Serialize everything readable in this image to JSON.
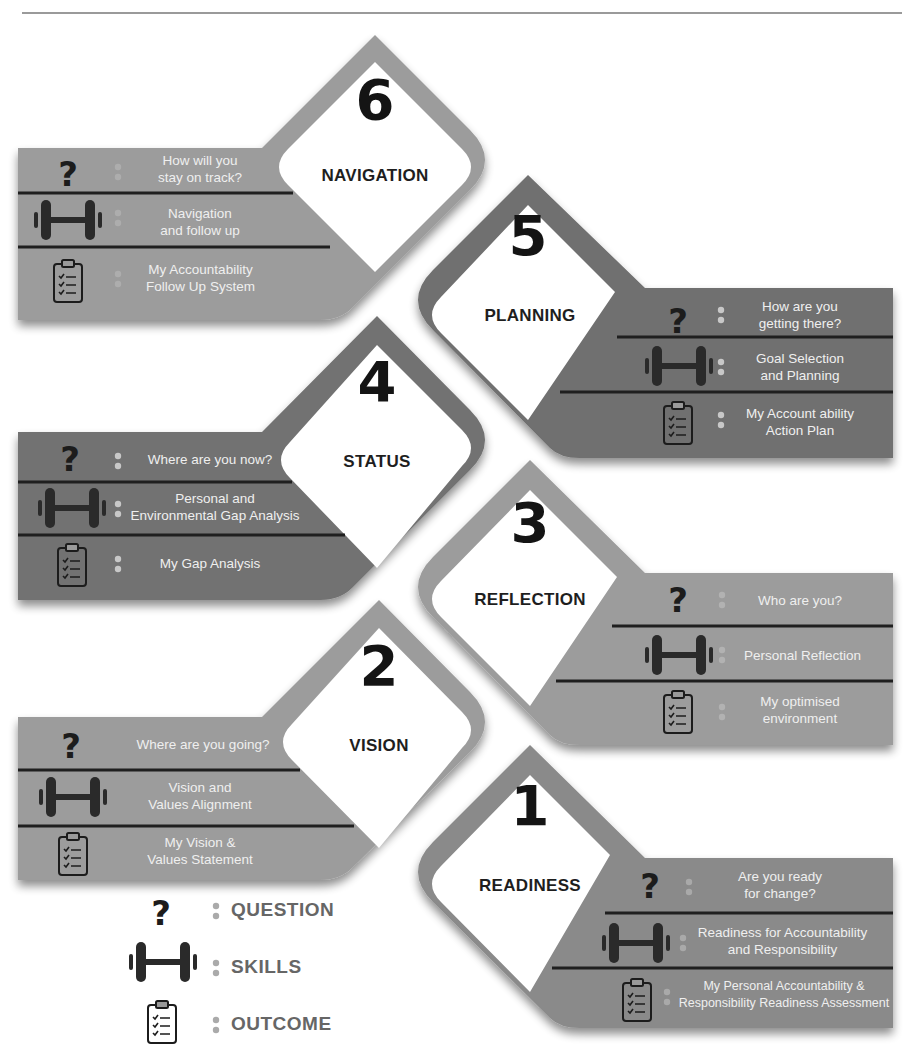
{
  "colors": {
    "band_light": "#9c9c9c",
    "band_mid": "#8a8a8a",
    "band_dark": "#6e6e6e",
    "frame_light": "#9a9a9a",
    "frame_dark": "#737373",
    "divider": "#1f1f1f",
    "label_text": "#efefef",
    "title_text": "#1e1e1e",
    "legend_text": "#666666"
  },
  "steps": [
    {
      "number": "6",
      "title": "NAVIGATION",
      "question": "How will you\nstay on track?",
      "skills": "Navigation\nand follow up",
      "outcome": "My Accountability\nFollow Up System"
    },
    {
      "number": "5",
      "title": "PLANNING",
      "question": "How are you\ngetting there?",
      "skills": "Goal Selection\nand Planning",
      "outcome": "My Account ability\nAction Plan"
    },
    {
      "number": "4",
      "title": "STATUS",
      "question": "Where are you now?",
      "skills": "Personal and\nEnvironmental Gap Analysis",
      "outcome": "My Gap Analysis"
    },
    {
      "number": "3",
      "title": "REFLECTION",
      "question": "Who are you?",
      "skills": "Personal Reflection",
      "outcome": "My optimised\nenvironment"
    },
    {
      "number": "2",
      "title": "VISION",
      "question": "Where are you going?",
      "skills": "Vision and\nValues Alignment",
      "outcome": "My Vision &\nValues Statement"
    },
    {
      "number": "1",
      "title": "READINESS",
      "question": "Are you ready\nfor change?",
      "skills": "Readiness for Accountability\nand Responsibility",
      "outcome": "My Personal Accountability &\nResponsibility Readiness  Assessment"
    }
  ],
  "legend": {
    "question": {
      "icon": "question-mark-icon",
      "label": "QUESTION"
    },
    "skills": {
      "icon": "dumbbell-icon",
      "label": "SKILLS"
    },
    "outcome": {
      "icon": "clipboard-checklist-icon",
      "label": "OUTCOME"
    }
  }
}
